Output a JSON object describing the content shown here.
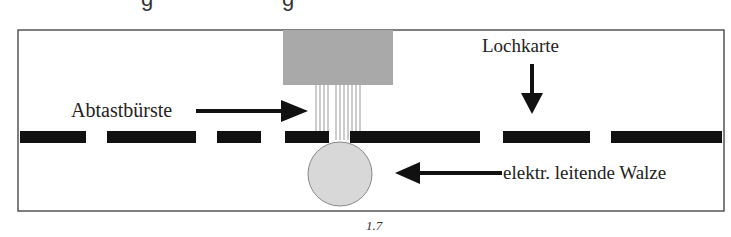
{
  "top_cut_text": {
    "fragment_1": "g",
    "fragment_2": "g"
  },
  "diagram": {
    "frame": {
      "x": 18,
      "y": 30,
      "w": 706,
      "h": 181,
      "stroke": "#555555"
    },
    "brush_head": {
      "x": 283,
      "y": 30,
      "w": 110,
      "h": 55,
      "fill": "#a9a9a9"
    },
    "brush_wires": {
      "xs": [
        316,
        320,
        324,
        328,
        336,
        340,
        344,
        348,
        352,
        356,
        360
      ],
      "y1": 85,
      "y2": 140,
      "stroke": "#999999"
    },
    "card_dashes": {
      "y": 131,
      "h": 12,
      "fill": "#111111",
      "segments": [
        [
          20,
          86
        ],
        [
          107,
          196
        ],
        [
          217,
          261
        ],
        [
          285,
          329
        ],
        [
          350,
          480
        ],
        [
          503,
          590
        ],
        [
          611,
          722
        ]
      ]
    },
    "roller": {
      "cx": 340,
      "cy": 174,
      "r": 32,
      "fill": "#d8d8d8",
      "stroke": "#888888"
    },
    "labels": {
      "brush": "Abtastbürste",
      "card": "Lochkarte",
      "roller": "elektr. leitende Walze"
    },
    "caption": "1.7"
  }
}
